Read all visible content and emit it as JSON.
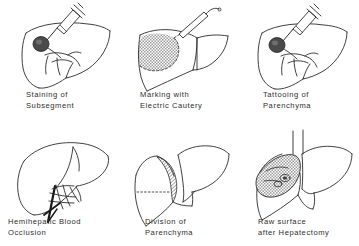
{
  "figure": {
    "background_color": "#ffffff",
    "ink_color": "#2b2b2b",
    "shade_color": "#a9a9a9",
    "layout": "3 columns x 2 rows grid of line-drawing panels"
  },
  "panels": [
    {
      "id": "staining-of-subsegment",
      "caption_line1": "Staining of",
      "caption_line2": "Subsegment",
      "caption": "Staining of\nSubsegment",
      "row": 1,
      "column": 1,
      "instrument": "syringe",
      "features": "liver outline with syringe needle inserted, dark stained nodule on left lobe, hepatic vessels at hilum"
    },
    {
      "id": "marking-with-electric-cautery",
      "caption_line1": "Marking with",
      "caption_line2": "Electric Cautery",
      "caption": "Marking with\nElectric Cautery",
      "row": 1,
      "column": 2,
      "instrument": "electric cautery",
      "features": "liver with stippled demarcation area bounded by dashed line, cautery pen tip at upper margin"
    },
    {
      "id": "tattooing-of-parenchyma",
      "caption_line1": "Tattooing of",
      "caption_line2": "Parenchyma",
      "caption": "Tattooing of\nParenchyma",
      "row": 1,
      "column": 3,
      "instrument": "syringe",
      "features": "liver outline with syringe injecting dye, dark tattoo mark on parenchyma"
    },
    {
      "id": "hemihepatic-blood-occlusion",
      "caption_line1": "Hemihepatic Blood",
      "caption_line2": "Occlusion",
      "caption": "Hemihepatic Blood\nOcclusion",
      "row": 2,
      "column": 1,
      "instrument": "vascular clamp and ligature",
      "features": "liver viewed from below with hilar vessels, dark clamp occluding hemihepatic inflow"
    },
    {
      "id": "division-of-parenchyma",
      "caption_line1": "Division of",
      "caption_line2": "Parenchyma",
      "caption": "Division of\nParenchyma",
      "row": 2,
      "column": 2,
      "instrument": "none",
      "features": "liver split along a crescent hatched transection plane, dotted reference line across cut surface"
    },
    {
      "id": "raw-surface-after-hepatectomy",
      "caption_line1": "Raw surface",
      "caption_line2": "after Hepatectomy",
      "caption": "Raw surface\nafter Hepatectomy",
      "row": 2,
      "column": 3,
      "instrument": "none",
      "features": "remaining liver with stippled raw cut surface showing ligated vessel stumps"
    }
  ]
}
